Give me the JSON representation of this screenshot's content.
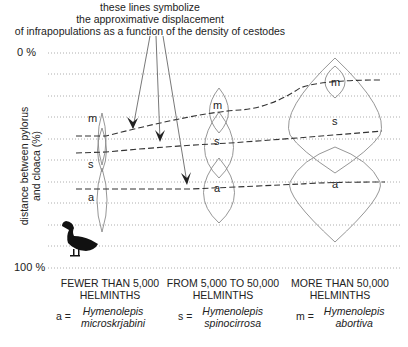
{
  "title": {
    "lines": [
      "these lines symbolize",
      "the approximative displacement",
      "of infrapopulations as a function of the density of cestodes"
    ]
  },
  "y_axis": {
    "label_line1": "distance between pylorus",
    "label_line2": "and cloaca (%)",
    "top_tick": "0 %",
    "bottom_tick": "100 %"
  },
  "categories": [
    {
      "line1": "FEWER THAN 5,000",
      "line2": "HELMINTHS"
    },
    {
      "line1": "FROM 5,000 TO 50,000",
      "line2": "HELMINTHS"
    },
    {
      "line1": "MORE THAN 50,000",
      "line2": "HELMINTHS"
    }
  ],
  "legend": [
    {
      "key": "a =",
      "genus": "Hymenolepis",
      "species": "microskrjabini"
    },
    {
      "key": "s =",
      "genus": "Hymenolepis",
      "species": "spinocirrosa"
    },
    {
      "key": "m =",
      "genus": "Hymenolepis",
      "species": "abortiva"
    }
  ],
  "shape_labels": {
    "low": {
      "m": "m",
      "s": "s",
      "a": "a"
    },
    "mid": {
      "m": "m",
      "s": "s",
      "a": "a"
    },
    "high": {
      "m": "m",
      "s": "s",
      "a": "a"
    }
  },
  "icons": {
    "bird": "duck-silhouette-icon"
  },
  "colors": {
    "gridline": "#999999",
    "shape_outline": "#8a8a8a",
    "dashed_line": "#333333",
    "text": "#222222"
  }
}
